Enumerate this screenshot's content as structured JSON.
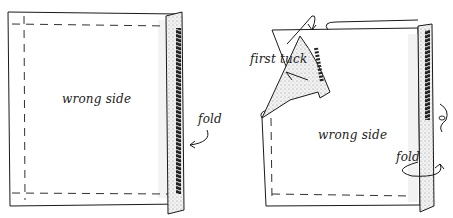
{
  "figure": {
    "left_panel": {
      "center_label": "wrong side",
      "fold_label": "fold"
    },
    "right_panel": {
      "tuck_label": "first tuck",
      "center_label": "wrong side",
      "fold_label": "fold"
    },
    "colors": {
      "ink": "#1a1a1a",
      "paper": "#ffffff",
      "shade": "#e6e6e6"
    }
  }
}
